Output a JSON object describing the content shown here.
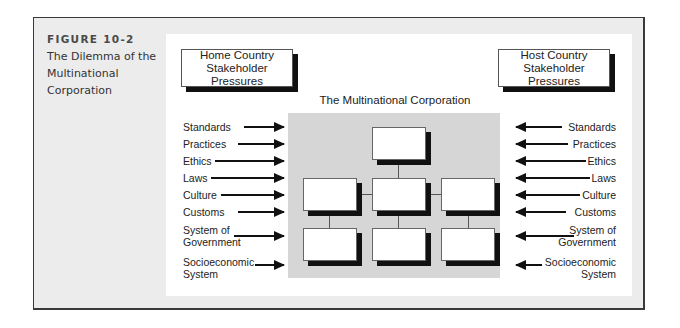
{
  "figure": {
    "number": "FIGURE 10-2",
    "title": "The Dilemma of the Multinational Corporation"
  },
  "diagram": {
    "home_box": "Home Country Stakeholder Pressures",
    "host_box": "Host Country Stakeholder Pressures",
    "center_title": "The Multinational Corporation",
    "left_labels": [
      "Standards",
      "Practices",
      "Ethics",
      "Laws",
      "Culture",
      "Customs",
      "System of Government",
      "Socioeconomic System"
    ],
    "right_labels": [
      "Standards",
      "Practices",
      "Ethics",
      "Laws",
      "Culture",
      "Customs",
      "System of Government",
      "Socioeconomic System"
    ],
    "org_chart": {
      "levels": [
        1,
        3,
        3
      ]
    }
  },
  "colors": {
    "outer_bg": "#ececec",
    "panel_bg": "#ffffff",
    "corp_bg": "#d6d6d6",
    "shadow": "#111111"
  }
}
